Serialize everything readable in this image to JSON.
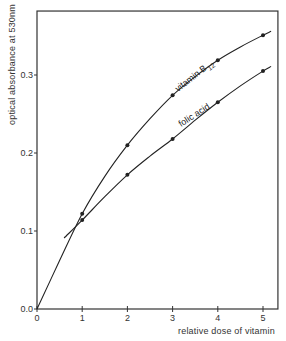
{
  "chart_data": {
    "type": "line",
    "title": "",
    "xlabel": "relative dose of vitamin",
    "ylabel": "optical absorbance at 530nm",
    "xlim": [
      0,
      5.33
    ],
    "ylim": [
      0,
      0.382
    ],
    "xticks": [
      0,
      1,
      2,
      3,
      4,
      5
    ],
    "xtick_labels": [
      "0",
      "1",
      "2",
      "3",
      "4",
      "5"
    ],
    "yticks": [
      0.0,
      0.1,
      0.2,
      0.3
    ],
    "ytick_labels": [
      "0.0",
      "0.1",
      "0.2",
      "0.3"
    ],
    "grid": false,
    "legend": "inline curve labels",
    "series": [
      {
        "name": "vitamin B12",
        "label_main": "vitamin B",
        "label_sub": "12",
        "points": [
          {
            "x": 1,
            "y": 0.122
          },
          {
            "x": 2,
            "y": 0.21
          },
          {
            "x": 3,
            "y": 0.274
          },
          {
            "x": 4,
            "y": 0.319
          },
          {
            "x": 5,
            "y": 0.351
          }
        ],
        "curve": [
          [
            0,
            0
          ],
          [
            0.5,
            0.062
          ],
          [
            1,
            0.122
          ],
          [
            1.5,
            0.17
          ],
          [
            2,
            0.21
          ],
          [
            2.5,
            0.244
          ],
          [
            3,
            0.274
          ],
          [
            3.5,
            0.298
          ],
          [
            4,
            0.319
          ],
          [
            4.5,
            0.336
          ],
          [
            5,
            0.351
          ],
          [
            5.18,
            0.356
          ]
        ]
      },
      {
        "name": "folic acid",
        "label_main": "folic acid",
        "label_sub": "",
        "points": [
          {
            "x": 1,
            "y": 0.114
          },
          {
            "x": 2,
            "y": 0.172
          },
          {
            "x": 3,
            "y": 0.218
          },
          {
            "x": 4,
            "y": 0.265
          },
          {
            "x": 5,
            "y": 0.305
          }
        ],
        "curve": [
          [
            0.6,
            0.091
          ],
          [
            1,
            0.114
          ],
          [
            1.5,
            0.144
          ],
          [
            2,
            0.172
          ],
          [
            2.5,
            0.196
          ],
          [
            3,
            0.218
          ],
          [
            3.5,
            0.242
          ],
          [
            4,
            0.265
          ],
          [
            4.5,
            0.286
          ],
          [
            5,
            0.305
          ],
          [
            5.18,
            0.311
          ]
        ]
      }
    ]
  },
  "colors": {
    "line": "#222222",
    "axis": "#333333",
    "background": "#ffffff"
  }
}
